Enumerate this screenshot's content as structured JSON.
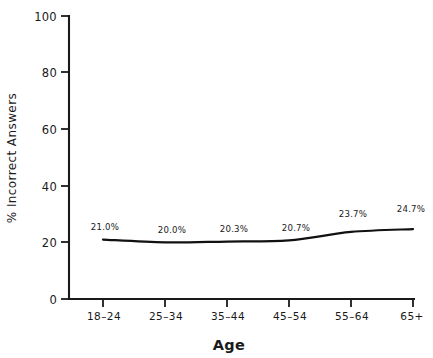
{
  "chart_data": {
    "type": "line",
    "title": "",
    "xlabel": "Age",
    "ylabel": "% Incorrect Answers",
    "categories": [
      "18–24",
      "25–34",
      "35–44",
      "45–54",
      "55–64",
      "65+"
    ],
    "values": [
      21.0,
      20.0,
      20.3,
      20.7,
      23.7,
      24.7
    ],
    "point_labels": [
      "21.0%",
      "20.0%",
      "20.3%",
      "20.7%",
      "23.7%",
      "24.7%"
    ],
    "ylim": [
      0,
      100
    ],
    "yticks": [
      0,
      20,
      40,
      60,
      80,
      100
    ],
    "ytick_labels": [
      "0",
      "20",
      "40",
      "60",
      "80",
      "100"
    ],
    "grid": false,
    "legend": false,
    "legend_position": "none",
    "line_color": "#111111",
    "background_color": "#ffffff",
    "axis_color": "#1a1a1a"
  },
  "axis": {
    "x_title": "Age",
    "y_title": "% Incorrect Answers"
  },
  "ytick_labels": {
    "t0": "0",
    "t1": "20",
    "t2": "40",
    "t3": "60",
    "t4": "80",
    "t5": "100"
  },
  "xtick_labels": {
    "t0": "18–24",
    "t1": "25–34",
    "t2": "35–44",
    "t3": "45–54",
    "t4": "55–64",
    "t5": "65+"
  },
  "point_labels": {
    "p0": "21.0%",
    "p1": "20.0%",
    "p2": "20.3%",
    "p3": "20.7%",
    "p4": "23.7%",
    "p5": "24.7%"
  }
}
